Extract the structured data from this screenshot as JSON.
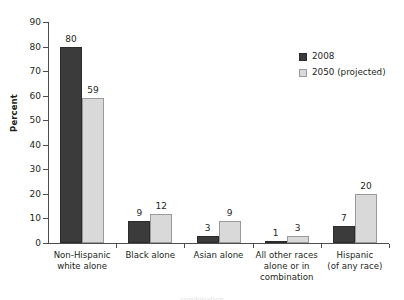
{
  "chart_data": {
    "type": "bar",
    "title": "",
    "xlabel": "",
    "ylabel": "Percent",
    "ylim": [
      0,
      90
    ],
    "ytick_step": 10,
    "yticks": [
      0,
      10,
      20,
      30,
      40,
      50,
      60,
      70,
      80,
      90
    ],
    "grid": false,
    "legend_position": "top-right",
    "categories": [
      "Non-Hispanic white alone",
      "Black alone",
      "Asian alone",
      "All other races alone or in combination",
      "Hispanic (of any race)"
    ],
    "category_lines": [
      [
        "Non-Hispanic",
        "white alone"
      ],
      [
        "Black alone"
      ],
      [
        "Asian alone"
      ],
      [
        "All other races",
        "alone or in",
        "combination"
      ],
      [
        "Hispanic",
        "(of any race)"
      ]
    ],
    "series": [
      {
        "name": "2008",
        "color": "#3b3b3b",
        "values": [
          80,
          9,
          3,
          1,
          7
        ]
      },
      {
        "name": "2050 (projected)",
        "color": "#d9d9d9",
        "values": [
          59,
          12,
          9,
          3,
          20
        ]
      }
    ]
  },
  "legend": {
    "items": [
      {
        "label": "2008"
      },
      {
        "label": "2050 (projected)"
      }
    ]
  },
  "axis": {
    "y_title": "Percent"
  },
  "colors": {
    "series_2008": "#3b3b3b",
    "series_2050": "#d9d9d9",
    "axis": "#4d4d4d",
    "text": "#231f20"
  },
  "bottom_caption": "combination"
}
